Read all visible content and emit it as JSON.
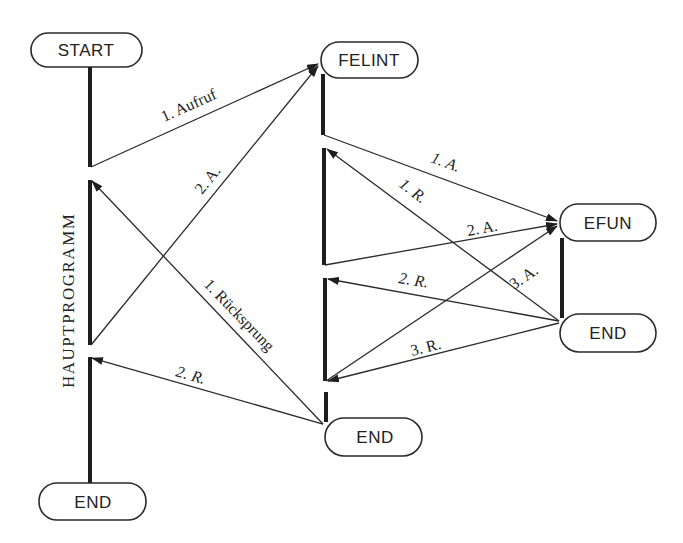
{
  "diagram": {
    "title_vertical": "HAUPTPROGRAMM",
    "nodes": {
      "start": "START",
      "main_end": "END",
      "felint": "FELINT",
      "felint_end": "END",
      "efun": "EFUN",
      "efun_end": "END"
    },
    "edges": {
      "aufruf_1": "1. Aufruf",
      "aufruf_2": "2. A.",
      "ruecksprung_1": "1. Rücksprung",
      "ruecksprung_2": "2. R.",
      "efun_call_1": "1. A.",
      "efun_ret_1": "1. R.",
      "efun_call_2": "2. A.",
      "efun_ret_2": "2. R.",
      "efun_call_3": "3. A.",
      "efun_ret_3": "3. R."
    },
    "colors": {
      "ink": "#222222",
      "background": "#ffffff"
    }
  }
}
